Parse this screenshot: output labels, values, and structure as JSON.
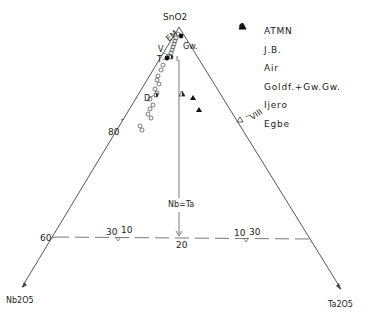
{
  "diagram": {
    "type": "ternary",
    "vertices": {
      "top": "SnO2",
      "bottom_left": "Nb2O5",
      "bottom_right": "Ta2O5"
    },
    "scale_labels": {
      "left_80": "80",
      "left_60": "60",
      "center_20": "20",
      "left_ratio": "30",
      "left_ratio_b": "10",
      "right_ratio": "10",
      "right_ratio_b": "30"
    },
    "divider_label": "Nb=Ta",
    "point_labels": {
      "em": "EM",
      "gw": "Gw.",
      "v": "V",
      "t": "T",
      "i": "I",
      "d": "D",
      "viii": "VIII"
    }
  },
  "legend": {
    "items": [
      {
        "symbol": "open-circle",
        "label": "ATMN"
      },
      {
        "symbol": "half-filled-circle",
        "label": "J.B."
      },
      {
        "symbol": "filled-circle",
        "label": "Air"
      },
      {
        "symbol": "open-triangle",
        "label": "Goldf.+Gw.Gw."
      },
      {
        "symbol": "half-filled-triangle",
        "label": "Ijero"
      },
      {
        "symbol": "filled-triangle",
        "label": "Egbe"
      }
    ]
  },
  "colors": {
    "ink": "#222222",
    "background": "#ffffff"
  }
}
